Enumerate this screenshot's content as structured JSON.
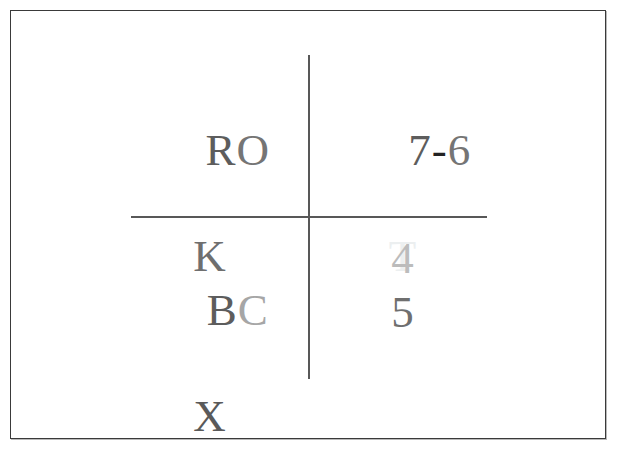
{
  "figure": {
    "background_color": "#ffffff",
    "frame_color": "#3a3a3a",
    "divider_color": "#585858"
  },
  "quadrants": {
    "top_left": {
      "name": "top-left",
      "primary": "RO",
      "secondary": "K",
      "primary_glyphs": [
        {
          "char": "R",
          "color": "#5d5d5d"
        },
        {
          "char": "O",
          "color": "#757575"
        }
      ],
      "secondary_color": "#6f6f6f"
    },
    "top_right": {
      "name": "top-right",
      "primary": "7-6",
      "secondary": "T",
      "primary_glyphs": [
        {
          "char": "7",
          "color": "#5d5d5d"
        },
        {
          "char": "-",
          "color": "#232323"
        },
        {
          "char": "6",
          "color": "#757575"
        }
      ],
      "secondary_color": "#eceff0"
    },
    "bottom_left": {
      "name": "bottom-left",
      "primary": "BC",
      "secondary": "X",
      "primary_glyphs": [
        {
          "char": "B",
          "color": "#5d5d5d"
        },
        {
          "char": "C",
          "color": "#a6a6a6"
        }
      ],
      "secondary_color": "#5a5a5a"
    },
    "bottom_right": {
      "name": "bottom-right",
      "primary": "4",
      "secondary": "5",
      "primary_glyphs": [
        {
          "char": "4",
          "color": "#bcbcbc"
        }
      ],
      "secondary_color": "#6f6f6f"
    }
  }
}
